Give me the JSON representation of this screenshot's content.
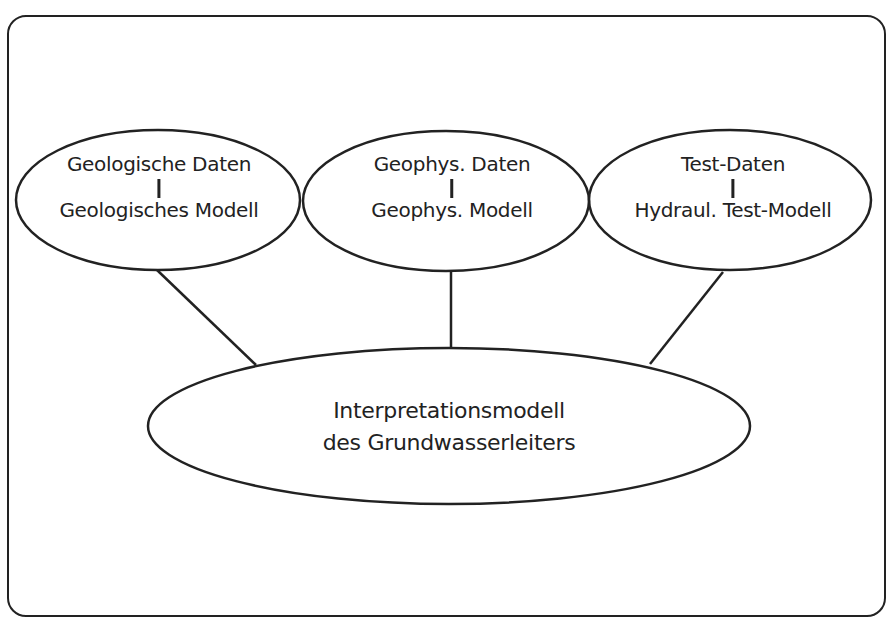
{
  "diagram": {
    "frame": {
      "stroke": "#222222",
      "background": "#ffffff"
    },
    "nodes": [
      {
        "id": "geologisch",
        "top_label": "Geologische Daten",
        "separator": "I",
        "bottom_label": "Geologisches Modell"
      },
      {
        "id": "geophysik",
        "top_label": "Geophys. Daten",
        "separator": "I",
        "bottom_label": "Geophys. Modell"
      },
      {
        "id": "test",
        "top_label": "Test-Daten",
        "separator": "I",
        "bottom_label": "Hydraul. Test-Modell"
      }
    ],
    "central_node": {
      "id": "interpretation",
      "line1": "Interpretationsmodell",
      "line2": "des Grundwasserleiters"
    },
    "edges": [
      {
        "from": "geologisch",
        "to": "interpretation"
      },
      {
        "from": "geophysik",
        "to": "interpretation"
      },
      {
        "from": "test",
        "to": "interpretation"
      }
    ],
    "colors": {
      "stroke": "#222222",
      "text": "#222222",
      "background": "#ffffff"
    }
  }
}
